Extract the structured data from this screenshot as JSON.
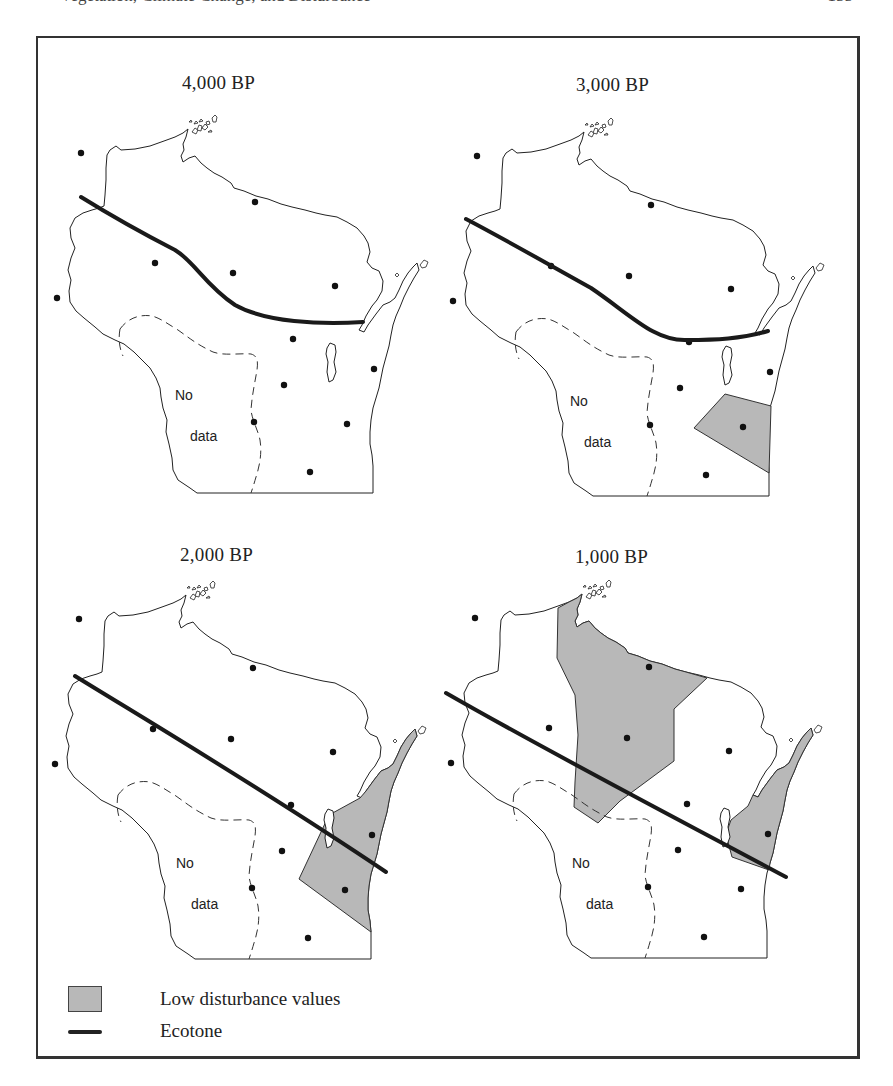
{
  "running_head": {
    "left": "Vegetation, Climate Change, and Disturbance",
    "right": "155"
  },
  "panels": [
    {
      "id": "p4000",
      "title": "4,000 BP",
      "dx": 0,
      "dy": 0
    },
    {
      "id": "p3000",
      "title": "3,000 BP",
      "dx": 396,
      "dy": 3
    },
    {
      "id": "p2000",
      "title": "2,000 BP",
      "dx": -2,
      "dy": 466
    },
    {
      "id": "p1000",
      "title": "1,000 BP",
      "dx": 394,
      "dy": 465
    }
  ],
  "no_data_label": {
    "line1": "No",
    "line2": "data"
  },
  "legend": {
    "items": [
      {
        "symbol": "gray-swatch",
        "label": "Low disturbance values"
      },
      {
        "symbol": "thick-line",
        "label": "Ecotone"
      }
    ]
  },
  "colors": {
    "low_disturbance_fill": "#b8b8b8",
    "ecotone": "#1a1a1a",
    "outline": "#222222"
  }
}
